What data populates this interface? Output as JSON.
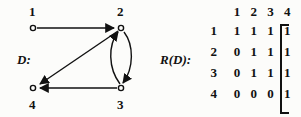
{
  "figure": {
    "digraph": {
      "label": "D:",
      "vertices": [
        {
          "id": "1",
          "label": "1",
          "x": 33,
          "y": 28,
          "label_x": 29,
          "label_y": 16
        },
        {
          "id": "2",
          "label": "2",
          "x": 121,
          "y": 28,
          "label_x": 117,
          "label_y": 16
        },
        {
          "id": "3",
          "label": "3",
          "x": 121,
          "y": 88,
          "label_x": 117,
          "label_y": 108
        },
        {
          "id": "4",
          "label": "4",
          "x": 33,
          "y": 88,
          "label_x": 29,
          "label_y": 108
        }
      ],
      "edges": [
        {
          "from": "1",
          "to": "2",
          "shape": "straight"
        },
        {
          "from": "2",
          "to": "4",
          "shape": "straight-diagonal"
        },
        {
          "from": "3",
          "to": "4",
          "shape": "straight"
        },
        {
          "from": "3",
          "to": "2",
          "shape": "curve-left"
        },
        {
          "from": "2",
          "to": "3",
          "shape": "curve-right"
        }
      ],
      "vertex_style": "open-circle",
      "edge_color": "#111111"
    },
    "matrix": {
      "label": "R(D):",
      "column_headers": [
        "1",
        "2",
        "3",
        "4"
      ],
      "row_headers": [
        "1",
        "2",
        "3",
        "4"
      ],
      "rows": [
        [
          "1",
          "1",
          "1",
          "1"
        ],
        [
          "0",
          "1",
          "1",
          "1"
        ],
        [
          "0",
          "1",
          "1",
          "1"
        ],
        [
          "0",
          "0",
          "0",
          "1"
        ]
      ],
      "bracket": "square"
    }
  }
}
